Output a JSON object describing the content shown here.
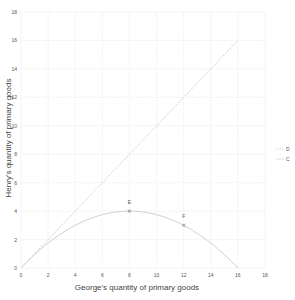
{
  "chart_data": {
    "type": "line",
    "title": "",
    "xlabel": "George's quantity of primary goods",
    "ylabel": "Henry's quantity of primary goods",
    "xlim": [
      0,
      18
    ],
    "ylim": [
      0,
      18
    ],
    "x_ticks": [
      0,
      2,
      4,
      6,
      8,
      10,
      12,
      14,
      16,
      18
    ],
    "y_ticks": [
      0,
      2,
      4,
      6,
      8,
      10,
      12,
      14,
      16,
      18
    ],
    "grid": true,
    "legend_position": "right",
    "series": [
      {
        "name": "D",
        "style": "dotted",
        "color": "#c8c8c8",
        "x": [
          0,
          16
        ],
        "y": [
          0,
          16
        ]
      },
      {
        "name": "C",
        "style": "solid",
        "color": "#cfcfcf",
        "x": [
          0,
          2,
          4,
          6,
          8,
          10,
          12,
          14,
          16
        ],
        "y": [
          0,
          1.75,
          3,
          3.75,
          4,
          3.75,
          3,
          1.75,
          0
        ]
      }
    ],
    "points": [
      {
        "label": "E",
        "x": 8,
        "y": 4
      },
      {
        "label": "F",
        "x": 12,
        "y": 3
      }
    ],
    "legend": [
      "D",
      "C"
    ]
  },
  "layout": {
    "plot_left": 21,
    "plot_right": 265,
    "plot_top": 12,
    "plot_bottom": 268
  }
}
